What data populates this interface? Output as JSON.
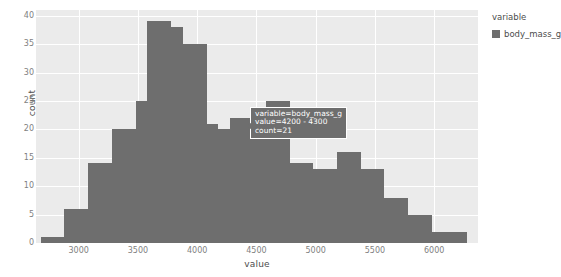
{
  "chart_data": {
    "type": "bar",
    "title": "",
    "xlabel": "value",
    "ylabel": "count",
    "xlim": [
      2640,
      6370
    ],
    "ylim": [
      0,
      41
    ],
    "grid": true,
    "bin_width": 100,
    "legend_position": "right",
    "bar_color": "#6e6e6e",
    "panel_color": "#ebebeb",
    "grid_color": "#ffffff",
    "series": [
      {
        "name": "body_mass_g",
        "bin_starts": [
          2700,
          2800,
          2900,
          3000,
          3100,
          3200,
          3300,
          3400,
          3500,
          3600,
          3700,
          3800,
          3900,
          4000,
          4100,
          4200,
          4300,
          4400,
          4500,
          4600,
          4700,
          4800,
          4900,
          5000,
          5100,
          5200,
          5300,
          5400,
          5500,
          5600,
          5700,
          5800,
          5900,
          6000,
          6100,
          6200,
          6300
        ],
        "values": [
          1,
          1,
          6,
          6,
          14,
          14,
          20,
          20,
          25,
          39,
          39,
          38,
          38,
          35,
          35,
          21,
          21,
          20,
          20,
          22,
          25,
          25,
          14,
          14,
          13,
          13,
          16,
          16,
          13,
          13,
          8,
          8,
          5,
          5,
          2,
          2,
          1
        ]
      }
    ],
    "bars": [
      {
        "x0": 2680,
        "x1": 2880,
        "value": 1
      },
      {
        "x0": 2880,
        "x1": 3080,
        "value": 6
      },
      {
        "x0": 3080,
        "x1": 3280,
        "value": 14
      },
      {
        "x0": 3280,
        "x1": 3480,
        "value": 20
      },
      {
        "x0": 3480,
        "x1": 3580,
        "value": 25
      },
      {
        "x0": 3580,
        "x1": 3780,
        "value": 39
      },
      {
        "x0": 3780,
        "x1": 3880,
        "value": 38
      },
      {
        "x0": 3880,
        "x1": 4080,
        "value": 35
      },
      {
        "x0": 4080,
        "x1": 4180,
        "value": 21
      },
      {
        "x0": 4180,
        "x1": 4280,
        "value": 20
      },
      {
        "x0": 4280,
        "x1": 4480,
        "value": 22
      },
      {
        "x0": 4480,
        "x1": 4580,
        "value": 21
      },
      {
        "x0": 4580,
        "x1": 4780,
        "value": 25
      },
      {
        "x0": 4780,
        "x1": 4980,
        "value": 14
      },
      {
        "x0": 4980,
        "x1": 5180,
        "value": 13
      },
      {
        "x0": 5180,
        "x1": 5380,
        "value": 16
      },
      {
        "x0": 5380,
        "x1": 5580,
        "value": 13
      },
      {
        "x0": 5580,
        "x1": 5780,
        "value": 8
      },
      {
        "x0": 5780,
        "x1": 5980,
        "value": 5
      },
      {
        "x0": 5980,
        "x1": 6280,
        "value": 2
      }
    ],
    "yticks": [
      0,
      5,
      10,
      15,
      20,
      25,
      30,
      35,
      40
    ],
    "ytick_labels": [
      "0",
      "5",
      "10",
      "15",
      "20",
      "25",
      "30",
      "35",
      "40"
    ],
    "xticks": [
      3000,
      3500,
      4000,
      4500,
      5000,
      5500,
      6000
    ],
    "xtick_labels": [
      "3000",
      "3500",
      "4000",
      "4500",
      "5000",
      "5500",
      "6000"
    ]
  },
  "legend": {
    "title": "variable",
    "entries": [
      {
        "label": "body_mass_g",
        "color": "#6e6e6e"
      }
    ]
  },
  "tooltip": {
    "line1": "variable=body_mass_g",
    "line2": "value=4200 - 4300",
    "line3": "count=21"
  }
}
